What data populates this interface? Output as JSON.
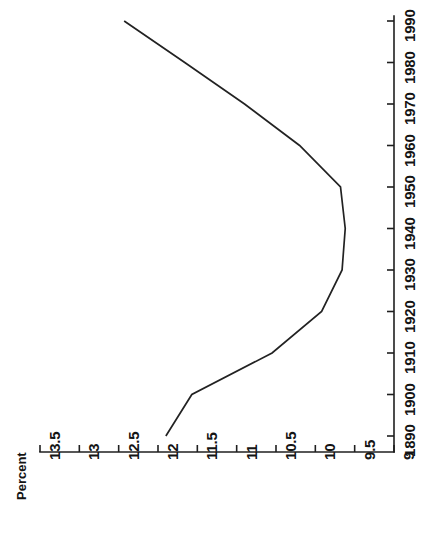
{
  "chart_data": {
    "type": "line",
    "title": "",
    "subtitle": "",
    "orientation": "rotated-90",
    "xlabel": "Percent",
    "ylabel": "",
    "value_axis": {
      "name": "Percent",
      "label": "Percent",
      "ticks": [
        "13.5",
        "13",
        "12.5",
        "12",
        "11.5",
        "11",
        "10.5",
        "10",
        "9.5",
        "9"
      ],
      "tick_values": [
        13.5,
        13,
        12.5,
        12,
        11.5,
        11,
        10.5,
        10,
        9.5,
        9
      ],
      "lim": [
        13.5,
        9
      ],
      "reversed": true,
      "position": "bottom"
    },
    "category_axis": {
      "name": "Year",
      "label": "",
      "ticks": [
        "1890",
        "1900",
        "1910",
        "1920",
        "1930",
        "1940",
        "1950",
        "1960",
        "1970",
        "1980",
        "1990"
      ],
      "tick_values": [
        1890,
        1900,
        1910,
        1920,
        1930,
        1940,
        1950,
        1960,
        1970,
        1980,
        1990
      ],
      "lim": [
        1890,
        1990
      ],
      "position": "right"
    },
    "x": [
      1890,
      1900,
      1910,
      1920,
      1930,
      1940,
      1950,
      1960,
      1970,
      1980,
      1990
    ],
    "values": [
      11.9,
      11.57,
      10.55,
      9.92,
      9.66,
      9.62,
      9.68,
      10.2,
      10.9,
      11.66,
      12.43
    ],
    "series": [
      {
        "name": "Percent",
        "x": [
          1890,
          1900,
          1910,
          1920,
          1930,
          1940,
          1950,
          1960,
          1970,
          1980,
          1990
        ],
        "values": [
          11.9,
          11.57,
          10.55,
          9.92,
          9.66,
          9.62,
          9.68,
          10.2,
          10.9,
          11.66,
          12.43
        ],
        "color": "#222222"
      }
    ],
    "grid": false,
    "legend": null,
    "annotations": [],
    "line_color": "#222222",
    "axis_color": "#1f1f1f",
    "background": "#ffffff"
  },
  "labels": {
    "percent_axis_title": "Percent",
    "value_ticks": [
      "13.5",
      "13",
      "12.5",
      "12",
      "11.5",
      "11",
      "10.5",
      "10",
      "9.5",
      "9"
    ],
    "year_ticks": [
      "1890",
      "1900",
      "1910",
      "1920",
      "1930",
      "1940",
      "1950",
      "1960",
      "1970",
      "1980",
      "1990"
    ]
  }
}
